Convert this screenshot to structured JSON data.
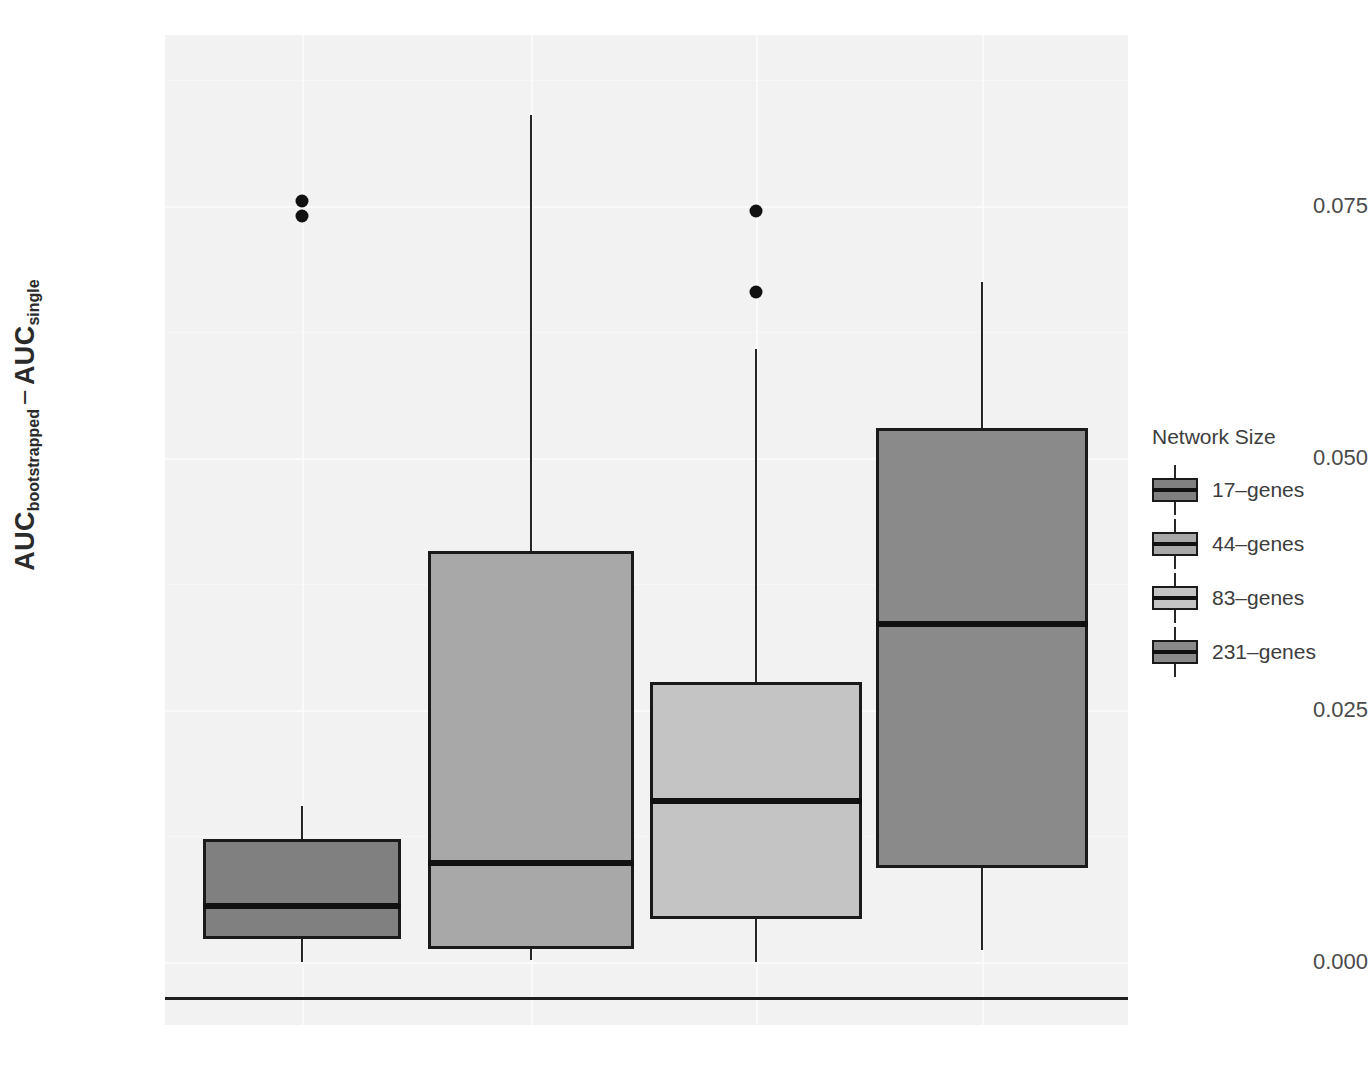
{
  "chart_data": {
    "type": "box",
    "title": "",
    "xlabel": "",
    "ylabel_parts": {
      "first_main": "AUC",
      "first_sub": "bootstrapped",
      "operator": "−",
      "second_main": "AUC",
      "second_sub": "single"
    },
    "ylabel": "AUC bootstrapped − AUC single",
    "ylim": [
      -0.0035,
      0.0963
    ],
    "yticks": [
      0.0,
      0.025,
      0.05,
      0.075
    ],
    "ytick_labels": [
      "0.000",
      "0.025",
      "0.050",
      "0.075"
    ],
    "grid": true,
    "grid_color": "#fafafa",
    "panel_background": "#f2f2f2",
    "legend": {
      "title": "Network Size",
      "position": "right",
      "entries": [
        {
          "label": "17–genes",
          "color": "#808080"
        },
        {
          "label": "44–genes",
          "color": "#a8a8a8"
        },
        {
          "label": "83–genes",
          "color": "#c4c4c4"
        },
        {
          "label": "231–genes",
          "color": "#8a8a8a"
        }
      ]
    },
    "categories": [
      "17–genes",
      "44–genes",
      "83–genes",
      "231–genes"
    ],
    "boxes": [
      {
        "name": "17–genes",
        "color": "#808080",
        "whisker_high": 0.0155,
        "q3": 0.0122,
        "median": 0.0056,
        "q1": 0.0023,
        "whisker_low": 0.0,
        "outliers": [
          0.0755,
          0.074
        ]
      },
      {
        "name": "44–genes",
        "color": "#a8a8a8",
        "whisker_high": 0.084,
        "q3": 0.0408,
        "median": 0.0098,
        "q1": 0.0013,
        "whisker_low": 0.0002,
        "outliers": []
      },
      {
        "name": "83–genes",
        "color": "#c4c4c4",
        "whisker_high": 0.0608,
        "q3": 0.0278,
        "median": 0.016,
        "q1": 0.0043,
        "whisker_low": 0.0,
        "outliers": [
          0.0745,
          0.0665
        ]
      },
      {
        "name": "231–genes",
        "color": "#8a8a8a",
        "whisker_high": 0.0675,
        "q3": 0.053,
        "median": 0.0335,
        "q1": 0.0093,
        "whisker_low": 0.0012,
        "outliers": []
      }
    ]
  },
  "geometry": {
    "panel": {
      "left": 165,
      "top": 35,
      "width": 963,
      "height": 990
    },
    "y_zero_px": 962,
    "px_per_unit": 10080,
    "box_centers_px": [
      302,
      531,
      756,
      982
    ],
    "box_width_px": [
      198,
      206,
      212,
      212
    ],
    "tick_px": [
      962,
      710,
      458,
      206
    ],
    "minor_grid_px": [
      836,
      584,
      332,
      80
    ],
    "v_grid_px": [
      302,
      531,
      756,
      982
    ],
    "axis_line_top": 997
  }
}
